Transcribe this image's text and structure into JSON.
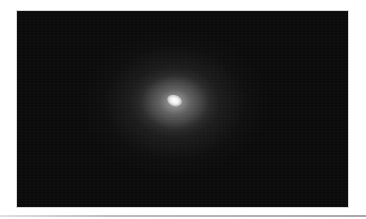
{
  "image": {
    "subject": "diffuse elliptical glow with bright core on dark background",
    "background_color": "#0b0b0b",
    "core_color": "#ffffff",
    "halo_color": "#6e6e6e",
    "core_position": {
      "x": 175,
      "y": 102
    },
    "frame": {
      "left": 17,
      "top": 11,
      "width": 331,
      "height": 196
    }
  },
  "page": {
    "background_color": "#ffffff",
    "rule_color": "#a9a9a9"
  }
}
